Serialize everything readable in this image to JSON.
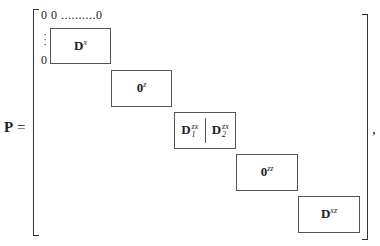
{
  "equation": {
    "lhs": "P",
    "equals": "=",
    "trailing": ","
  },
  "matrix": {
    "top_row": "0 0 ..........0",
    "left_column_dots": "⋮",
    "left_column_zero": "0",
    "blocks": [
      {
        "base": "D",
        "superscript": "x",
        "subscript": ""
      },
      {
        "base": "0",
        "superscript": "z",
        "subscript": ""
      },
      {
        "split": true,
        "left": {
          "base": "D",
          "superscript": "zx",
          "subscript": "1"
        },
        "right": {
          "base": "D",
          "superscript": "zx",
          "subscript": "2"
        }
      },
      {
        "base": "0",
        "superscript": "zz",
        "subscript": ""
      },
      {
        "base": "D",
        "superscript": "xz",
        "subscript": ""
      }
    ]
  }
}
